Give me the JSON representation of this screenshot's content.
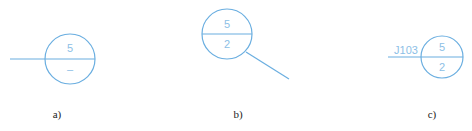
{
  "figures": [
    {
      "id": "a",
      "caption": "a)",
      "upper_value": "5",
      "lower_value": "–"
    },
    {
      "id": "b",
      "caption": "b)",
      "upper_value": "5",
      "lower_value": "2"
    },
    {
      "id": "c",
      "caption": "c)",
      "upper_value": "5",
      "lower_value": "2",
      "label": "J103"
    }
  ],
  "colors": {
    "line": "#6aaee0",
    "text": "#8cc0e6",
    "caption": "#222222"
  }
}
